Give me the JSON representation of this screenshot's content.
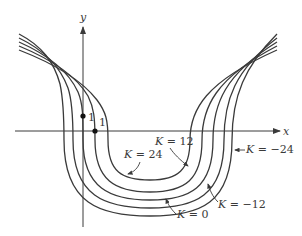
{
  "figure": {
    "type": "level-curves",
    "axes": {
      "x_label": "x",
      "y_label": "y",
      "origin": [
        83,
        131
      ],
      "x_axis": {
        "from": 15,
        "to": 280,
        "y": 131
      },
      "y_axis": {
        "from": 227,
        "to": 27,
        "x": 83
      }
    },
    "points": [
      {
        "name": "point-on-y-axis",
        "cx": 83,
        "cy": 116,
        "label": "1",
        "lx": 88,
        "ly": 121
      },
      {
        "name": "point-on-x-axis",
        "cx": 95,
        "cy": 131,
        "label": "1",
        "lx": 99,
        "ly": 126
      }
    ],
    "curves": [
      {
        "k": "24",
        "d": "M19,50 C50,62 80,78 97,100 C106,112 108,120 108,140 C108,172 122,180 150,180 C178,180 190,170 190,140 C190,110 205,82 277,50"
      },
      {
        "k": "12",
        "d": "M19,46 C48,58 75,74 88,96 C94,108 95,118 95,140 C95,180 115,192 150,192 C185,192 202,180 202,140 C202,108 215,78 277,46"
      },
      {
        "k": "0",
        "d": "M19,42 C46,54 68,70 78,92 C83,104 83,116 83,140 C83,188 110,200 150,200 C190,200 213,188 213,140 C213,104 225,74 277,42"
      },
      {
        "k": "-12",
        "d": "M19,38 C44,50 60,66 68,88 C72,100 73,114 73,140 C73,196 105,208 150,208 C195,208 224,196 224,140 C224,100 235,70 277,38"
      },
      {
        "k": "-24",
        "d": "M19,34 C42,46 54,62 60,84 C63,98 64,112 64,140 C64,204 100,216 150,216 C200,216 232,204 232,140 C232,96 245,66 277,34"
      }
    ],
    "annotations": [
      {
        "text": "K = 24",
        "x": 124,
        "y": 158,
        "arrow": "M140,162 C138,168 134,172 128,174"
      },
      {
        "text": "K = 12",
        "x": 155,
        "y": 145,
        "arrow": "M170,148 C174,154 180,160 188,166"
      },
      {
        "text": "K = 0",
        "x": 177,
        "y": 218,
        "arrow": "M176,214 C170,208 168,204 166,199"
      },
      {
        "text": "K = −12",
        "x": 218,
        "y": 208,
        "arrow": "M218,202 C212,196 210,190 208,184"
      },
      {
        "text": "K = −24",
        "x": 246,
        "y": 153,
        "arrow": "M245,150 L235,150"
      }
    ]
  }
}
